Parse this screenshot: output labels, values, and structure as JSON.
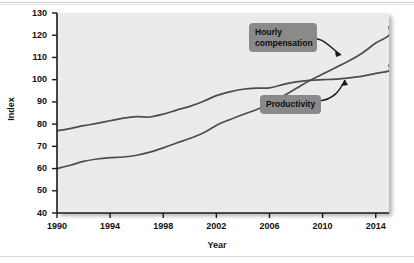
{
  "chart_data": {
    "type": "line",
    "title": "",
    "xlabel": "Year",
    "ylabel": "Index",
    "xlim": [
      1990,
      2015
    ],
    "ylim": [
      40,
      130
    ],
    "grid": false,
    "legend_position": "inline-annotations",
    "xticks": [
      "1990",
      "1994",
      "1998",
      "2002",
      "2006",
      "2010",
      "2014"
    ],
    "xtick_values": [
      1990,
      1994,
      1998,
      2002,
      2006,
      2010,
      2014
    ],
    "yticks": [
      "40",
      "50",
      "60",
      "70",
      "80",
      "90",
      "100",
      "110",
      "120",
      "130"
    ],
    "ytick_values": [
      40,
      50,
      60,
      70,
      80,
      90,
      100,
      110,
      120,
      130
    ],
    "x": [
      1990,
      1991,
      1992,
      1993,
      1994,
      1995,
      1996,
      1997,
      1998,
      1999,
      2000,
      2001,
      2002,
      2003,
      2004,
      2005,
      2006,
      2007,
      2008,
      2009,
      2010,
      2011,
      2012,
      2013,
      2014,
      2015
    ],
    "series": [
      {
        "name": "Productivity",
        "values": [
          77.0,
          78.0,
          79.3,
          80.3,
          81.5,
          82.7,
          83.4,
          83.2,
          84.5,
          86.3,
          88.0,
          90.2,
          92.8,
          94.5,
          95.7,
          96.2,
          96.3,
          97.8,
          99.0,
          99.7,
          100.0,
          100.2,
          100.8,
          101.6,
          102.8,
          104.0
        ],
        "annotation": "Productivity",
        "end_value": 106.5
      },
      {
        "name": "Hourly compensation",
        "values": [
          60.0,
          61.5,
          63.2,
          64.3,
          64.9,
          65.2,
          66.0,
          67.4,
          69.3,
          71.5,
          73.5,
          76.0,
          79.4,
          82.0,
          84.3,
          86.5,
          89.0,
          92.5,
          96.0,
          99.5,
          102.5,
          105.5,
          108.5,
          112.0,
          116.5,
          120.0
        ],
        "annotation": "Hourly compensation",
        "end_value": 123.8
      }
    ],
    "annotations": [
      {
        "label": "Hourly\ncompensation",
        "target_series": "Hourly compensation"
      },
      {
        "label": "Productivity",
        "target_series": "Productivity"
      }
    ],
    "colors": {
      "plot_background": "#ebebeb",
      "line": "#4d4d4d",
      "callout_background": "#8a8a8a",
      "text": "#111111",
      "page_background": "#ffffff"
    }
  }
}
